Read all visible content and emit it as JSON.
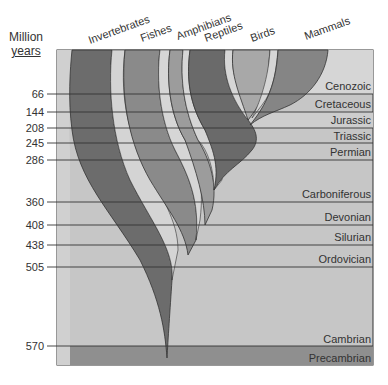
{
  "axis": {
    "title_line1": "Million",
    "title_line2": "years",
    "ticks": [
      {
        "label": "66",
        "value": 66
      },
      {
        "label": "144",
        "value": 144
      },
      {
        "label": "208",
        "value": 208
      },
      {
        "label": "245",
        "value": 245
      },
      {
        "label": "286",
        "value": 286
      },
      {
        "label": "360",
        "value": 360
      },
      {
        "label": "408",
        "value": 408
      },
      {
        "label": "438",
        "value": 438
      },
      {
        "label": "505",
        "value": 505
      },
      {
        "label": "570",
        "value": 570
      }
    ]
  },
  "groups": [
    {
      "label": "Invertebrates"
    },
    {
      "label": "Fishes"
    },
    {
      "label": "Amphibians"
    },
    {
      "label": "Reptiles"
    },
    {
      "label": "Birds"
    },
    {
      "label": "Mammals"
    }
  ],
  "periods": [
    {
      "label": "Cenozoic"
    },
    {
      "label": "Cretaceous"
    },
    {
      "label": "Jurassic"
    },
    {
      "label": "Triassic"
    },
    {
      "label": "Permian"
    },
    {
      "label": "Carboniferous"
    },
    {
      "label": "Devonian"
    },
    {
      "label": "Silurian"
    },
    {
      "label": "Ordovician"
    },
    {
      "label": "Cambrian"
    },
    {
      "label": "Precambrian"
    }
  ],
  "colors": {
    "background_band": "#c4c4c4",
    "band_light": "#d2d2d2",
    "precambrian": "#8e8e8e",
    "invertebrates": "#6e6e6e",
    "fishes": "#8a8a8a",
    "amphibians": "#9c9c9c",
    "reptiles": "#6a6a6a",
    "birds": "#a8a8a8",
    "mammals": "#858585",
    "light_strip": "#d8d8d8",
    "line": "#333333"
  }
}
